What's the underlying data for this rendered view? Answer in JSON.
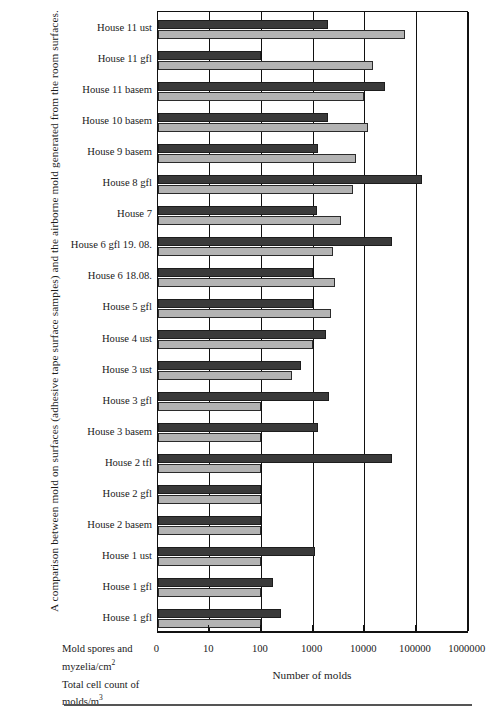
{
  "caption": "A comparison between mold on surfaces (adhesive tape surface samples) and the airborne mold generated from the room surfaces.",
  "axis": {
    "x_title": "Number of molds",
    "tick_labels": [
      "0",
      "10",
      "100",
      "1000",
      "10000",
      "100000",
      "1000000"
    ]
  },
  "units": {
    "surface_line1": "Mold spores and",
    "surface_line2": "myzelia/cm",
    "surface_sup": "2",
    "air_line1": "Total cell count of",
    "air_line2": "molds/m",
    "air_sup": "3"
  },
  "colors": {
    "dark_series": "#3a3a3a",
    "light_series": "#b3b3b3",
    "axis": "#111111"
  },
  "chart_data": {
    "type": "bar",
    "orientation": "horizontal",
    "title": "A comparison between mold on surfaces (adhesive tape surface samples) and the airborne mold generated from the room surfaces.",
    "xlabel": "Number of molds",
    "ylabel": "",
    "xscale": "log",
    "xlim": [
      1,
      1000000
    ],
    "xticks": [
      0,
      10,
      100,
      1000,
      10000,
      100000,
      1000000
    ],
    "grid": true,
    "legend": "none",
    "categories": [
      "House 11 ust",
      "House 11 gfl",
      "House 11 basem",
      "House 10 basem",
      "House 9 basem",
      "House 8 gfl",
      "House 7",
      "House 6 gfl 19. 08.",
      "House 6 18.08.",
      "House 5 gfl",
      "House 4 ust",
      "House 3 ust",
      "House 3 gfl",
      "House 3 basem",
      "House 2 tfl",
      "House 2 gfl",
      "House 2 basem",
      "House 1 ust",
      "House 1 gfl",
      "House 1 gfl"
    ],
    "series": [
      {
        "name": "Mold spores and myzelia/cm2",
        "color": "#3a3a3a",
        "values": [
          2000,
          100,
          25000,
          2000,
          1300,
          130000,
          1200,
          35000,
          1000,
          1000,
          1800,
          600,
          2100,
          1300,
          35000,
          100,
          100,
          1100,
          170,
          250
        ]
      },
      {
        "name": "Total cell count of molds/m3",
        "color": "#b3b3b3",
        "values": [
          60000,
          15000,
          10000,
          12000,
          7000,
          6000,
          3500,
          2500,
          2700,
          2300,
          1000,
          400,
          100,
          100,
          100,
          100,
          100,
          100,
          100,
          100
        ]
      }
    ]
  }
}
